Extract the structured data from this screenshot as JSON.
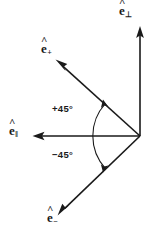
{
  "figure": {
    "name": "polarization-unit-vector-basis",
    "background_color": "#ffffff",
    "stroke_color": "#1a1a1a",
    "origin": {
      "x": 140,
      "y": 136
    },
    "labels": {
      "e_perp": {
        "base": "e",
        "hat": "^",
        "subscript": "⊥"
      },
      "e_plus": {
        "base": "e",
        "hat": "^",
        "subscript": "+"
      },
      "e_parallel": {
        "base": "e",
        "hat": "^",
        "subscript": "‖"
      },
      "e_minus": {
        "base": "e",
        "hat": "^",
        "subscript": "−"
      }
    },
    "angles": {
      "positive": "+45°",
      "negative": "−45°"
    },
    "vectors": [
      {
        "name": "e-perp-vector",
        "label": "ê⊥",
        "angle_deg": 90,
        "tip": {
          "x": 140,
          "y": 28
        }
      },
      {
        "name": "e-plus-vector",
        "label": "ê+",
        "angle_deg": 135,
        "tip": {
          "x": 56,
          "y": 60
        }
      },
      {
        "name": "e-parallel-vector",
        "label": "ê‖",
        "angle_deg": 180,
        "tip": {
          "x": 33,
          "y": 136
        }
      },
      {
        "name": "e-minus-vector",
        "label": "ê−",
        "angle_deg": 225,
        "tip": {
          "x": 58,
          "y": 215
        }
      }
    ],
    "arc": {
      "name": "angle-arc",
      "double_headed": true,
      "start": {
        "x": 104,
        "y": 101
      },
      "end": {
        "x": 104,
        "y": 170
      }
    }
  }
}
